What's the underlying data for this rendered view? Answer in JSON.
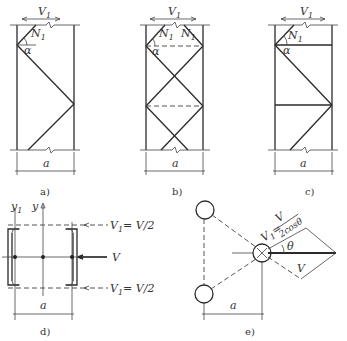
{
  "panels": {
    "a": {
      "caption": "a)",
      "force_label": "V",
      "force_sub": "1",
      "diag_label": "N",
      "diag_sub": "1",
      "angle": "α",
      "width_label": "a"
    },
    "b": {
      "caption": "b)",
      "force_label": "V",
      "force_sub": "1",
      "diag_label": "N",
      "diag_sub": "1",
      "diag_label2": "N",
      "diag_sub2": "1",
      "angle": "α",
      "width_label": "a"
    },
    "c": {
      "caption": "c)",
      "force_label": "V",
      "force_sub": "1",
      "diag_label": "N",
      "diag_sub": "1",
      "angle": "α",
      "width_label": "a"
    },
    "d": {
      "caption": "d)",
      "axis_y": "y",
      "axis_y1": "y",
      "axis_y1_sub": "1",
      "force_top": "V",
      "force_top_sub": "1",
      "force_top_eq": "= V/2",
      "force_mid": "V",
      "force_bot": "V",
      "force_bot_sub": "1",
      "force_bot_eq": "= V/2",
      "width_label": "a"
    },
    "e": {
      "caption": "e)",
      "force_eq_lhs": "V",
      "force_eq_sub": "1",
      "force_eq_num": "V",
      "force_eq_den": "2cosθ",
      "angle": "θ",
      "force_main": "V",
      "width_label": "a"
    }
  }
}
